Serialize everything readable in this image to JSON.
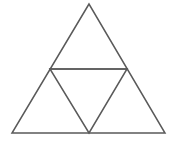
{
  "figure": {
    "background_color": "#ffffff",
    "stroke_color": "#5a5a5a",
    "stroke_width": 1.5,
    "canvas": {
      "width": 175,
      "height": 143
    }
  },
  "chart_data": {
    "type": "diagram",
    "subtitle": "",
    "xlabel": "",
    "ylabel": "",
    "grid": false,
    "legend": "none",
    "coordinate_space": {
      "x_range": [
        0,
        175
      ],
      "y_range": [
        0,
        143
      ],
      "y_axis_down": true
    },
    "points": [
      {
        "id": "A",
        "role": "outer-apex",
        "x": 89,
        "y": 4
      },
      {
        "id": "B",
        "role": "outer-bottom-left",
        "x": 12,
        "y": 133
      },
      {
        "id": "C",
        "role": "outer-bottom-right",
        "x": 165,
        "y": 133
      },
      {
        "id": "M_AB",
        "role": "midpoint-left",
        "x": 50,
        "y": 69
      },
      {
        "id": "M_AC",
        "role": "midpoint-right",
        "x": 127,
        "y": 69
      },
      {
        "id": "M_BC",
        "role": "midpoint-bottom",
        "x": 89,
        "y": 133
      }
    ],
    "segments": [
      {
        "id": "seg-outer-left",
        "from": "A",
        "to": "B",
        "label": "outer left side"
      },
      {
        "id": "seg-outer-right",
        "from": "A",
        "to": "C",
        "label": "outer right side"
      },
      {
        "id": "seg-outer-base",
        "from": "B",
        "to": "C",
        "label": "outer base"
      },
      {
        "id": "seg-midline",
        "from": "M_AB",
        "to": "M_AC",
        "label": "horizontal midline"
      },
      {
        "id": "seg-inner-left",
        "from": "M_AB",
        "to": "M_BC",
        "label": "inner left side"
      },
      {
        "id": "seg-inner-right",
        "from": "M_AC",
        "to": "M_BC",
        "label": "inner right side"
      }
    ],
    "faces": [
      {
        "id": "face-top",
        "label": "top sub-triangle",
        "vertices": [
          "A",
          "M_AB",
          "M_AC"
        ]
      },
      {
        "id": "face-left",
        "label": "bottom-left sub-triangle",
        "vertices": [
          "M_AB",
          "B",
          "M_BC"
        ]
      },
      {
        "id": "face-right",
        "label": "bottom-right sub-triangle",
        "vertices": [
          "M_AC",
          "M_BC",
          "C"
        ]
      },
      {
        "id": "face-middle",
        "label": "inverted middle sub-triangle",
        "vertices": [
          "M_AB",
          "M_AC",
          "M_BC"
        ]
      }
    ],
    "counts": {
      "sub_triangles": 4,
      "vertices": 6,
      "segments": 6
    },
    "paths": {
      "outer_triangle": "M 89 4 L 12 133 L 165 133 Z",
      "inner_triangle": "M 50 69 L 127 69 L 89 133 Z",
      "midline": "M 50 69 L 127 69",
      "face_top": "M 89 4 L 50 69 L 127 69 Z",
      "face_left": "M 50 69 L 12 133 L 89 133 Z",
      "face_right": "M 127 69 L 89 133 L 165 133 Z",
      "face_middle": "M 50 69 L 127 69 L 89 133 Z"
    },
    "annotations": [],
    "tick_labels": [],
    "vertex_labels": []
  }
}
